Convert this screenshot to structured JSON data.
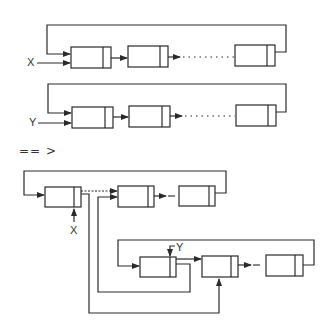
{
  "diagram": {
    "list_x": {
      "pointer_label": "X",
      "nodes": 3
    },
    "list_y": {
      "pointer_label": "Y",
      "nodes": 3
    },
    "transform_symbol": "== >",
    "result": {
      "pointer_x_label": "X",
      "pointer_y_label": "Y"
    }
  },
  "colors": {
    "line": "#2a2a2a",
    "background": "#ffffff"
  }
}
